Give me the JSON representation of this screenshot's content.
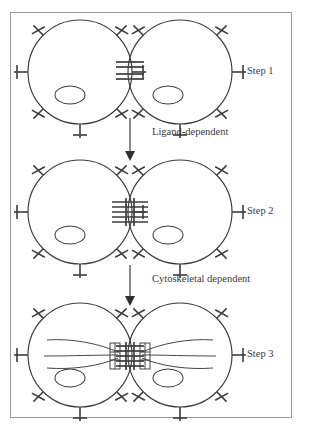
{
  "figure": {
    "kind": "cell-adhesion-junction-maturation-diagram",
    "frame": {
      "x": 10,
      "y": 12,
      "width": 282,
      "height": 406,
      "border_color": "#9a9a9a"
    },
    "stroke_color": "#3c3c3c",
    "background": "#ffffff"
  },
  "panels": [
    {
      "id": "step1",
      "label": "Step 1",
      "label_x": 247,
      "label_y": 65,
      "junction_type": "few-scattered-bars",
      "junction_bar_count": 4,
      "cells": [
        {
          "cx": 80,
          "cy": 72,
          "r": 52,
          "nucleus": {
            "cx": 70,
            "cy": 95,
            "rx": 15,
            "ry": 9
          }
        },
        {
          "cx": 180,
          "cy": 72,
          "r": 52,
          "nucleus": {
            "cx": 168,
            "cy": 95,
            "rx": 15,
            "ry": 9
          }
        }
      ],
      "has_filaments": false
    },
    {
      "id": "step2",
      "label": "Step 2",
      "label_x": 247,
      "label_y": 205,
      "junction_type": "clustered-bars",
      "junction_bar_count": 5,
      "cells": [
        {
          "cx": 80,
          "cy": 212,
          "r": 52,
          "nucleus": {
            "cx": 70,
            "cy": 235,
            "rx": 15,
            "ry": 9
          }
        },
        {
          "cx": 180,
          "cy": 212,
          "r": 52,
          "nucleus": {
            "cx": 168,
            "cy": 235,
            "rx": 15,
            "ry": 9
          }
        }
      ],
      "has_filaments": false
    },
    {
      "id": "step3",
      "label": "Step 3",
      "label_x": 247,
      "label_y": 348,
      "junction_type": "clustered-bars-with-plaques",
      "junction_bar_count": 5,
      "cells": [
        {
          "cx": 80,
          "cy": 355,
          "r": 52,
          "nucleus": {
            "cx": 70,
            "cy": 378,
            "rx": 15,
            "ry": 9
          }
        },
        {
          "cx": 180,
          "cy": 355,
          "r": 52,
          "nucleus": {
            "cx": 168,
            "cy": 378,
            "rx": 15,
            "ry": 9
          }
        }
      ],
      "has_filaments": true,
      "filament_description": "cytoskeletal fibers fanning from junction plaques into each cell"
    }
  ],
  "arrows": [
    {
      "id": "arrow-1",
      "x": 130,
      "y_start": 118,
      "y_end": 160,
      "label": "Ligand-dependent",
      "label_x": 152,
      "label_y": 126
    },
    {
      "id": "arrow-2",
      "x": 130,
      "y_start": 265,
      "y_end": 305,
      "label": "Cytoskeletal dependent",
      "label_x": 152,
      "label_y": 273
    }
  ],
  "labels": {
    "step_1": "Step 1",
    "step_2": "Step 2",
    "step_3": "Step 3",
    "ligand_dependent": "Ligand-dependent",
    "cytoskeletal_dependent": "Cytoskeletal dependent"
  },
  "receptor_spikes": {
    "count_per_cell": 7,
    "description": "radial stalks crossed by a short perpendicular cap bar"
  }
}
